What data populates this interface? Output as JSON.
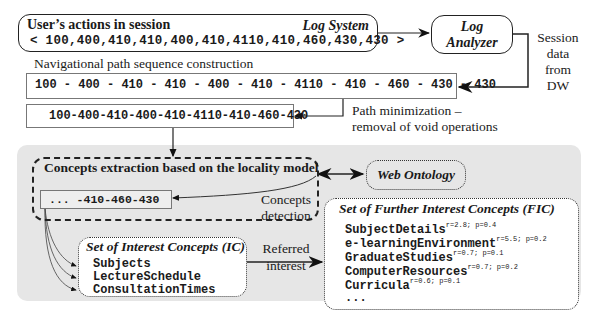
{
  "log_system": {
    "title": "User’s actions in session",
    "system_label": "Log System",
    "sequence": "< 100,400,410,410,400,410,4110,410,460,430,430 >"
  },
  "log_analyzer": {
    "line1": "Log",
    "line2": "Analyzer"
  },
  "session_data": {
    "line1": "Session",
    "line2": "data",
    "line3": "from",
    "line4": "DW"
  },
  "navigation": {
    "label": "Navigational path sequence construction",
    "sequence": "100 - 400 - 410 - 410 - 400 - 410 - 4110 - 410 - 460 - 430 - 430"
  },
  "minimization": {
    "sequence": "100-400-410-400-410-4110-410-460-430",
    "label_line1": "Path minimization –",
    "label_line2": "removal of void operations"
  },
  "concepts_extraction": {
    "title": "Concepts extraction based on the locality model",
    "sequence": "... -410-460-430",
    "detection_line1": "Concepts",
    "detection_line2": "detection"
  },
  "web_ontology": {
    "label": "Web Ontology"
  },
  "interest_concepts": {
    "title": "Set of Interest Concepts (IC)",
    "items": [
      "Subjects",
      "LectureSchedule",
      "ConsultationTimes"
    ]
  },
  "referred_interest": {
    "line1": "Referred",
    "line2": "interest"
  },
  "further_interest_concepts": {
    "title": "Set of Further Interest Concepts (FIC)",
    "items": [
      {
        "name": "SubjectDetails",
        "meta": "r=2.8; p=0.4"
      },
      {
        "name": "e-learningEnvironment",
        "meta": "r=5.5; p=0.2"
      },
      {
        "name": "GraduateStudies",
        "meta": "r=0.7; p=0.1"
      },
      {
        "name": "ComputerResources",
        "meta": "r=0.7; p=0.2"
      },
      {
        "name": "Curricula",
        "meta": "r=0.6; p=0.1"
      },
      {
        "name": "...",
        "meta": ""
      }
    ]
  }
}
